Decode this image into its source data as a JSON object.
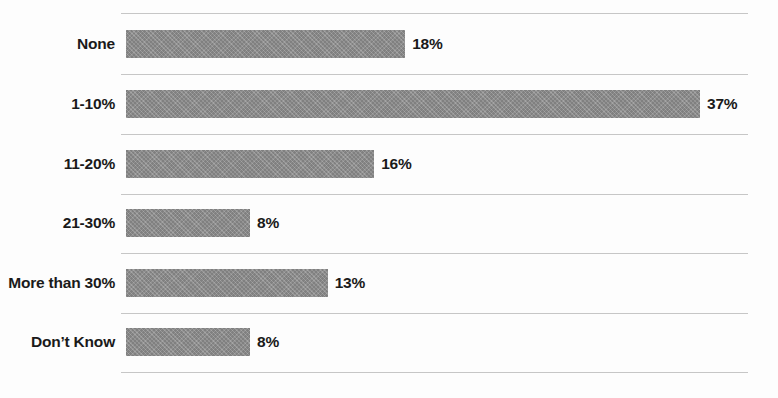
{
  "chart_data": {
    "type": "bar",
    "orientation": "horizontal",
    "title": "",
    "subtitle": "",
    "xlabel": "",
    "ylabel": "",
    "categories": [
      "None",
      "1-10%",
      "11-20%",
      "21-30%",
      "More than 30%",
      "Don’t Know"
    ],
    "values": [
      18,
      37,
      16,
      8,
      13,
      8
    ],
    "value_labels": [
      "18%",
      "37%",
      "16%",
      "8%",
      "13%",
      "8%"
    ],
    "xlim": [
      0,
      40
    ],
    "grid": true,
    "gridlines": "horizontal-row-separators",
    "legend": "none",
    "annotations": [],
    "series": [
      {
        "name": "",
        "values": [
          18,
          37,
          16,
          8,
          13,
          8
        ]
      }
    ]
  },
  "style": {
    "bar_color": "#8c8c8c",
    "gridline_color": "#c6c6c6",
    "text_color": "#1a1a1a",
    "background_color": "#fdfdfd"
  },
  "rows": [
    {
      "label": "None",
      "value_label": "18%",
      "value": 18
    },
    {
      "label": "1-10%",
      "value_label": "37%",
      "value": 37
    },
    {
      "label": "11-20%",
      "value_label": "16%",
      "value": 16
    },
    {
      "label": "21-30%",
      "value_label": "8%",
      "value": 8
    },
    {
      "label": "More than 30%",
      "value_label": "13%",
      "value": 13
    },
    {
      "label": "Don’t Know",
      "value_label": "8%",
      "value": 8
    }
  ]
}
